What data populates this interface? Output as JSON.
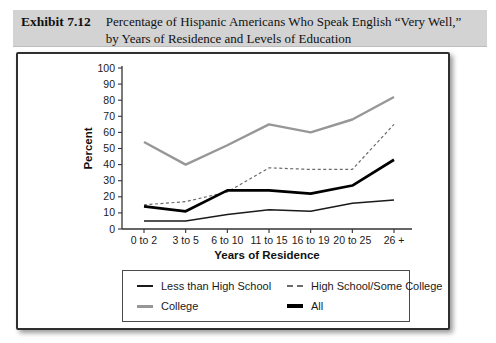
{
  "header": {
    "exhibit_label": "Exhibit 7.12",
    "title_line1": "Percentage of Hispanic Americans Who Speak English “Very Well,”",
    "title_line2": "by Years of Residence and Levels of Education"
  },
  "colors": {
    "header_bg": "#d3d3d3",
    "panel_border": "#2f2f2f",
    "axis": "#333333",
    "tick_text": "#1a1a1a"
  },
  "chart_data": {
    "type": "line",
    "title": "",
    "xlabel": "Years of Residence",
    "ylabel": "Percent",
    "ylim": [
      0,
      100
    ],
    "ytick_step": 10,
    "grid": false,
    "legend_position": "bottom",
    "categories": [
      "0 to 2",
      "3 to 5",
      "6 to 10",
      "11 to 15",
      "16 to 19",
      "20 to 25",
      "26 +"
    ],
    "series": [
      {
        "name": "Less than High School",
        "values": [
          5,
          5,
          9,
          12,
          11,
          16,
          18
        ],
        "color": "#1a1a1a",
        "stroke_width": 1.4,
        "dash": null,
        "marker_css": "2px solid #1a1a1a"
      },
      {
        "name": "High School/Some College",
        "values": [
          15,
          17,
          23,
          38,
          37,
          37,
          65
        ],
        "color": "#6b6b6b",
        "stroke_width": 1.2,
        "dash": "3 2.5",
        "marker_css": "2px dashed #6b6b6b"
      },
      {
        "name": "College",
        "values": [
          54,
          40,
          52,
          65,
          60,
          68,
          82
        ],
        "color": "#979797",
        "stroke_width": 2.4,
        "dash": null,
        "marker_css": "3px solid #979797"
      },
      {
        "name": "All",
        "values": [
          14,
          11,
          24,
          24,
          22,
          27,
          43
        ],
        "color": "#000000",
        "stroke_width": 2.7,
        "dash": null,
        "marker_css": "4px solid #000000"
      }
    ]
  }
}
